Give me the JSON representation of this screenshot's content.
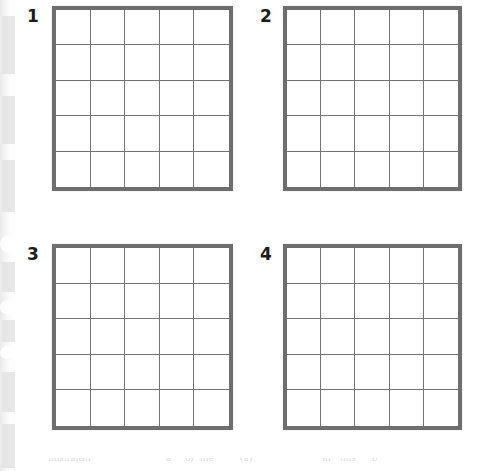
{
  "page": {
    "background_color": "#ffffff",
    "width": 488,
    "height": 471
  },
  "style": {
    "grid_border_color": "#6e6e6e",
    "grid_line_color": "#737373",
    "number_color": "#1c1c1c",
    "scan_edge_color": "#e8e8e8"
  },
  "panels": [
    {
      "number": "1",
      "number_x": 27,
      "number_y": 8,
      "box_x": 52,
      "box_y": 6,
      "box_w": 181,
      "box_h": 185,
      "columns": 5,
      "rows": 5
    },
    {
      "number": "2",
      "number_x": 260,
      "number_y": 8,
      "box_x": 283,
      "box_y": 6,
      "box_w": 179,
      "box_h": 185,
      "columns": 5,
      "rows": 5
    },
    {
      "number": "3",
      "number_x": 27,
      "number_y": 246,
      "box_x": 52,
      "box_y": 244,
      "box_w": 181,
      "box_h": 186,
      "columns": 5,
      "rows": 5
    },
    {
      "number": "4",
      "number_x": 260,
      "number_y": 246,
      "box_x": 283,
      "box_y": 244,
      "box_w": 179,
      "box_h": 186,
      "columns": 5,
      "rows": 5
    }
  ],
  "scan_artifacts": {
    "left_gutter": true,
    "blobs": [
      {
        "top": 236,
        "height": 16
      },
      {
        "top": 300,
        "height": 14
      },
      {
        "top": 346,
        "height": 13
      }
    ],
    "smudges": [
      {
        "top": 16,
        "height": 58
      },
      {
        "top": 96,
        "height": 48
      },
      {
        "top": 160,
        "height": 52
      },
      {
        "top": 262,
        "height": 30
      },
      {
        "top": 320,
        "height": 22
      },
      {
        "top": 372,
        "height": 40
      },
      {
        "top": 424,
        "height": 44
      }
    ]
  },
  "bottom_ghost_text": {
    "fragments": [
      {
        "text": "llustrate",
        "x": 48
      },
      {
        "text": "in",
        "x": 82
      },
      {
        "text": "a",
        "x": 166
      },
      {
        "text": "of",
        "x": 185
      },
      {
        "text": "the",
        "x": 200
      },
      {
        "text": "(a)",
        "x": 240
      },
      {
        "text": "in",
        "x": 322
      },
      {
        "text": "this",
        "x": 340
      },
      {
        "text": "b",
        "x": 372
      }
    ]
  }
}
